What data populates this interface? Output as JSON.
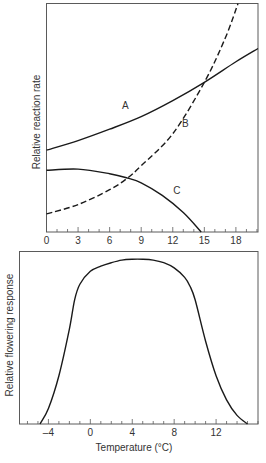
{
  "chart_data": [
    {
      "type": "line",
      "title": "",
      "xlabel": "",
      "ylabel": "Relative reaction rate",
      "xlim": [
        0,
        20.1
      ],
      "ylim": [
        0,
        100
      ],
      "x_ticks": [
        0,
        3,
        6,
        9,
        12,
        15,
        18
      ],
      "x_minor_tick_step": 1,
      "grid": false,
      "legend": "inline curve labels",
      "series": [
        {
          "name": "A",
          "style": "solid",
          "x": [
            0,
            3,
            6,
            9,
            12,
            15,
            18,
            20.1
          ],
          "values": [
            35.8,
            40.0,
            45.0,
            50.5,
            57.5,
            65.5,
            74.5,
            80.3
          ],
          "label_pos": [
            7.5,
            54
          ]
        },
        {
          "name": "B",
          "style": "dashed",
          "x": [
            0,
            3,
            6,
            7.7,
            9,
            12,
            15,
            17,
            18.2
          ],
          "values": [
            7.9,
            12.0,
            18.5,
            23.6,
            29.0,
            43.0,
            65.5,
            85.0,
            100
          ],
          "label_pos": [
            13.2,
            46
          ]
        },
        {
          "name": "C",
          "style": "solid",
          "x": [
            0,
            3,
            6,
            7.7,
            9,
            11,
            13,
            14.7
          ],
          "values": [
            27.0,
            27.5,
            25.5,
            23.6,
            21.5,
            16.0,
            8.5,
            0
          ],
          "label_pos": [
            12.4,
            16.5
          ]
        }
      ]
    },
    {
      "type": "line",
      "title": "",
      "xlabel": "Temperature (°C)",
      "ylabel": "Relative flowering response",
      "xlim": [
        -6.76,
        16.0
      ],
      "ylim": [
        0,
        100
      ],
      "x_ticks": [
        -4,
        0,
        4,
        8,
        12
      ],
      "x_minor_tick_step": 1,
      "grid": false,
      "series": [
        {
          "name": "Flowering response",
          "style": "solid",
          "x": [
            -4.8,
            -4,
            -3,
            -2,
            -1.5,
            -1,
            0,
            1,
            2,
            3,
            4,
            5,
            6,
            7,
            8,
            9,
            9.5,
            10,
            11,
            12,
            13,
            14,
            15
          ],
          "values": [
            0,
            9,
            28,
            55,
            72,
            81,
            88.5,
            91.5,
            93.5,
            95,
            95.5,
            95.5,
            95,
            93.5,
            90.5,
            85,
            80,
            72,
            48,
            28,
            14,
            5,
            0
          ]
        }
      ]
    }
  ],
  "figure": {
    "caption": ""
  }
}
